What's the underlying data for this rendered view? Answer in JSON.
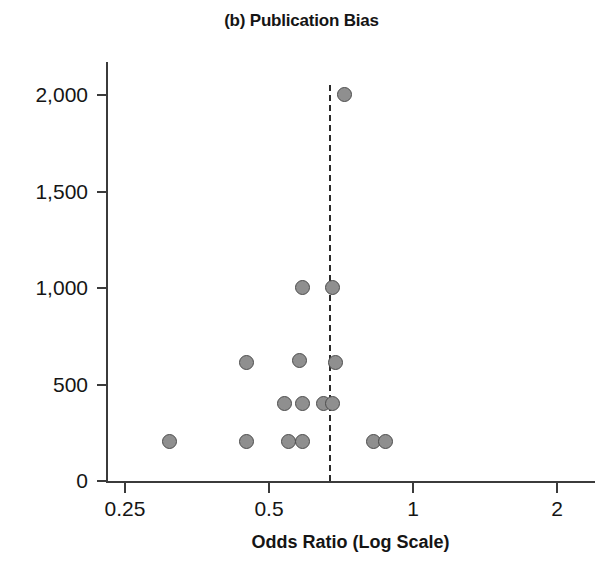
{
  "chart_data": {
    "type": "scatter",
    "title": "(b) Publication Bias",
    "xlabel": "Odds Ratio (Log Scale)",
    "ylabel": "",
    "x_scale": "log",
    "xlim": [
      0.25,
      2
    ],
    "ylim": [
      0,
      2100
    ],
    "grid": false,
    "legend": null,
    "x_ticks": [
      {
        "value": 0.25,
        "label": "0.25"
      },
      {
        "value": 0.5,
        "label": "0.5"
      },
      {
        "value": 1,
        "label": "1"
      },
      {
        "value": 2,
        "label": "2"
      }
    ],
    "y_ticks": [
      {
        "value": 0,
        "label": "0"
      },
      {
        "value": 500,
        "label": "500"
      },
      {
        "value": 1000,
        "label": "1,000"
      },
      {
        "value": 1500,
        "label": "1,500"
      },
      {
        "value": 2000,
        "label": "2,000"
      }
    ],
    "annotations": [
      {
        "name": "pooled-effect-reference-line",
        "type": "vline",
        "x": 0.67,
        "style": "dashed"
      }
    ],
    "marker": {
      "shape": "circle",
      "fill": "#8f8f8f",
      "edge": "#4d4d4d",
      "size": 15
    },
    "points": [
      {
        "x": 0.72,
        "y": 2000
      },
      {
        "x": 0.59,
        "y": 1000
      },
      {
        "x": 0.68,
        "y": 1000
      },
      {
        "x": 0.45,
        "y": 610
      },
      {
        "x": 0.58,
        "y": 620
      },
      {
        "x": 0.69,
        "y": 610
      },
      {
        "x": 0.54,
        "y": 400
      },
      {
        "x": 0.59,
        "y": 400
      },
      {
        "x": 0.65,
        "y": 400
      },
      {
        "x": 0.68,
        "y": 400
      },
      {
        "x": 0.31,
        "y": 200
      },
      {
        "x": 0.45,
        "y": 200
      },
      {
        "x": 0.55,
        "y": 200
      },
      {
        "x": 0.59,
        "y": 200
      },
      {
        "x": 0.83,
        "y": 200
      },
      {
        "x": 0.88,
        "y": 200
      }
    ]
  }
}
